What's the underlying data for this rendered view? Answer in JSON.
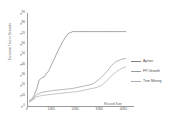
{
  "chart_data": {
    "type": "line",
    "title": "",
    "xlabel": "Record Size",
    "ylabel": "Execution Time in Seconds",
    "xlim": [
      0,
      4400
    ],
    "ylim": [
      0,
      90
    ],
    "grid": false,
    "legend_position": "right",
    "x_ticks": [
      "0",
      "1000",
      "2000",
      "3000",
      "4000"
    ],
    "x_tick_values": [
      0,
      1000,
      2000,
      3000,
      4000
    ],
    "y_ticks": [
      "0",
      "10",
      "20",
      "30",
      "40",
      "50",
      "60",
      "70",
      "80",
      "90"
    ],
    "y_tick_values": [
      0,
      10,
      20,
      30,
      40,
      50,
      60,
      70,
      80,
      90
    ],
    "series": [
      {
        "name": "Apriori",
        "color": "#808080",
        "x": [
          100,
          250,
          400,
          500,
          600,
          700,
          900,
          1100,
          1300,
          1500,
          1700,
          1900,
          2100,
          2600,
          3000,
          3400,
          3800,
          4100
        ],
        "values": [
          5,
          8,
          16,
          25,
          27,
          28,
          34,
          44,
          54,
          63,
          70,
          72,
          72,
          72,
          72,
          72,
          72,
          72
        ]
      },
      {
        "name": "FP-Growth",
        "color": "#9a9a9a",
        "x": [
          100,
          250,
          400,
          600,
          800,
          1100,
          1500,
          1900,
          2300,
          2700,
          2900,
          3100,
          3300,
          3500,
          3700,
          3900,
          4100
        ],
        "values": [
          4,
          7,
          11,
          13,
          14,
          15,
          16,
          17,
          19,
          21,
          24,
          28,
          33,
          39,
          43,
          45,
          46
        ]
      },
      {
        "name": "Tree Mining",
        "color": "#adadad",
        "x": [
          100,
          250,
          400,
          600,
          900,
          1300,
          1700,
          2100,
          2500,
          2900,
          3100,
          3300,
          3500,
          3700,
          3900,
          4100
        ],
        "values": [
          4,
          6,
          9,
          10,
          11,
          12,
          13,
          14,
          16,
          18,
          20,
          24,
          29,
          33,
          36,
          38
        ]
      }
    ]
  },
  "legend": {
    "items": [
      {
        "label": "Apriori",
        "color": "#808080"
      },
      {
        "label": "FP-Growth",
        "color": "#9a9a9a"
      },
      {
        "label": "Tree Mining",
        "color": "#adadad"
      }
    ]
  }
}
